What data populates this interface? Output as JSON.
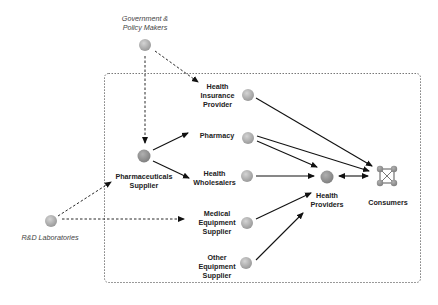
{
  "diagram": {
    "colors": {
      "node": "#a9a9a9",
      "edge": "#111111",
      "boundary": "#555555",
      "external_label": "#444444"
    },
    "boundary": {
      "style": "dashed",
      "label": ""
    },
    "nodes": {
      "gov": {
        "label": "Government &\nPolicy Makers",
        "type": "external"
      },
      "rnd": {
        "label": "R&D Laboratories",
        "type": "external"
      },
      "pharma_supplier": {
        "label": "Pharmaceuticals\nSupplier",
        "type": "internal"
      },
      "insurance": {
        "label": "Health\nInsurance\nProvider",
        "type": "internal"
      },
      "pharmacy": {
        "label": "Pharmacy",
        "type": "internal"
      },
      "wholesalers": {
        "label": "Health\nWholesalers",
        "type": "internal"
      },
      "medical_equipment": {
        "label": "Medical\nEquipment\nSupplier",
        "type": "internal"
      },
      "other_equipment": {
        "label": "Other\nEquipment\nSupplier",
        "type": "internal"
      },
      "providers": {
        "label": "Health\nProviders",
        "type": "internal"
      },
      "consumers": {
        "label": "Consumers",
        "type": "network-icon"
      }
    },
    "edges": [
      {
        "from": "gov",
        "to": "pharma_supplier",
        "style": "dashed"
      },
      {
        "from": "gov",
        "to": "insurance",
        "style": "dashed"
      },
      {
        "from": "rnd",
        "to": "pharma_supplier",
        "style": "dashed"
      },
      {
        "from": "rnd",
        "to": "medical_equipment",
        "style": "dashed"
      },
      {
        "from": "pharma_supplier",
        "to": "pharmacy",
        "style": "solid"
      },
      {
        "from": "pharma_supplier",
        "to": "wholesalers",
        "style": "solid"
      },
      {
        "from": "insurance",
        "to": "consumers",
        "style": "solid"
      },
      {
        "from": "pharmacy",
        "to": "consumers",
        "style": "solid"
      },
      {
        "from": "pharmacy",
        "to": "providers",
        "style": "solid"
      },
      {
        "from": "wholesalers",
        "to": "providers",
        "style": "solid"
      },
      {
        "from": "medical_equipment",
        "to": "providers",
        "style": "solid"
      },
      {
        "from": "other_equipment",
        "to": "providers",
        "style": "solid"
      },
      {
        "from": "providers",
        "to": "consumers",
        "style": "solid-bidirectional"
      }
    ]
  }
}
